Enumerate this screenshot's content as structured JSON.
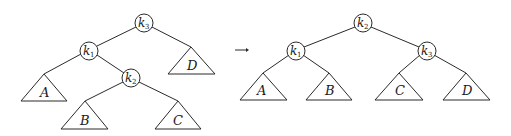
{
  "diagram": {
    "type": "tree-rotation",
    "arrow": "→",
    "before": {
      "root": {
        "key": "k",
        "sub": "3"
      },
      "nodes": [
        {
          "id": "k3",
          "key": "k",
          "sub": "3",
          "parent": null
        },
        {
          "id": "k1",
          "key": "k",
          "sub": "1",
          "parent": "k3",
          "side": "left"
        },
        {
          "id": "k2",
          "key": "k",
          "sub": "2",
          "parent": "k1",
          "side": "right"
        }
      ],
      "subtrees": [
        {
          "label": "A",
          "parent": "k1",
          "side": "left"
        },
        {
          "label": "B",
          "parent": "k2",
          "side": "left"
        },
        {
          "label": "C",
          "parent": "k2",
          "side": "right"
        },
        {
          "label": "D",
          "parent": "k3",
          "side": "right"
        }
      ]
    },
    "after": {
      "root": {
        "key": "k",
        "sub": "2"
      },
      "nodes": [
        {
          "id": "k2",
          "key": "k",
          "sub": "2",
          "parent": null
        },
        {
          "id": "k1",
          "key": "k",
          "sub": "1",
          "parent": "k2",
          "side": "left"
        },
        {
          "id": "k3",
          "key": "k",
          "sub": "3",
          "parent": "k2",
          "side": "right"
        }
      ],
      "subtrees": [
        {
          "label": "A",
          "parent": "k1",
          "side": "left"
        },
        {
          "label": "B",
          "parent": "k1",
          "side": "right"
        },
        {
          "label": "C",
          "parent": "k3",
          "side": "left"
        },
        {
          "label": "D",
          "parent": "k3",
          "side": "right"
        }
      ]
    },
    "labels": {
      "k": "k",
      "s1": "1",
      "s2": "2",
      "s3": "3",
      "A": "A",
      "B": "B",
      "C": "C",
      "D": "D"
    }
  }
}
